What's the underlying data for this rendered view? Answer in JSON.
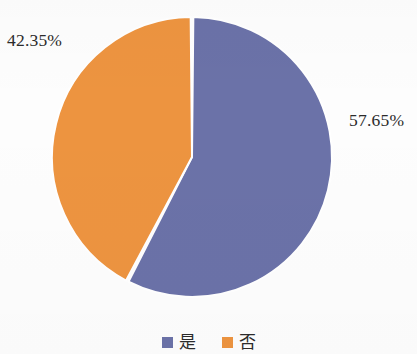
{
  "chart_data": {
    "type": "pie",
    "title": "",
    "subtitle": "",
    "xlabel": "",
    "ylabel": "",
    "grid": false,
    "legend_position": "bottom",
    "categories": [
      "是",
      "否"
    ],
    "values": [
      57.65,
      42.35
    ],
    "value_unit": "%",
    "slices": [
      {
        "label": "是",
        "value": 57.65,
        "value_label": "57.65%",
        "color": "#6B72A8",
        "start_angle_deg": 0,
        "end_angle_deg": 207.54
      },
      {
        "label": "否",
        "value": 42.35,
        "value_label": "42.35%",
        "color": "#ED9440",
        "start_angle_deg": 207.54,
        "end_angle_deg": 360
      }
    ],
    "annotations": [
      {
        "text": "42.35%",
        "position": "top-left"
      },
      {
        "text": "57.65%",
        "position": "right"
      }
    ]
  },
  "labels": {
    "no_percent": "42.35%",
    "yes_percent": "57.65%"
  },
  "legend": {
    "items": [
      {
        "label": "是",
        "color": "#6B72A8"
      },
      {
        "label": "否",
        "color": "#ED9440"
      }
    ]
  },
  "colors": {
    "series_yes": "#6B72A8",
    "series_no": "#ED9440",
    "background": "#FDFDFD",
    "text": "#2B2B2B",
    "slice_gap": "#FFFFFF"
  },
  "geometry": {
    "center_x": 192,
    "center_y": 157,
    "radius": 140
  }
}
